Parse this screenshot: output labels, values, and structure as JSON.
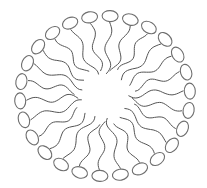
{
  "diagram": {
    "type": "micelle",
    "center": [
      105,
      96
    ],
    "ring_radius": [
      85,
      80
    ],
    "head_count": 26,
    "head_size": [
      8,
      5.5
    ],
    "tail_inner_radius": 0.28,
    "tail_wave_amplitude": 4,
    "tail_waves": 1.5,
    "colors": {
      "background": "#ffffff",
      "head_stroke": "#6e6e6e",
      "tail_stroke": "#555555"
    }
  }
}
